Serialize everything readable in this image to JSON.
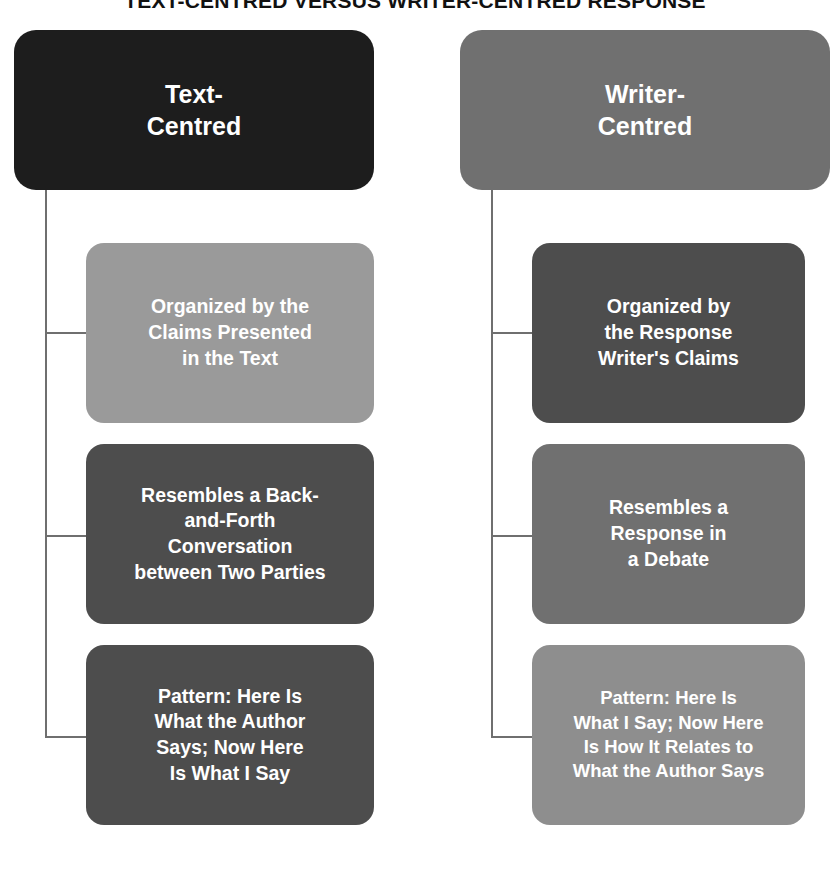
{
  "title": "TEXT-CENTRED VERSUS WRITER-CENTRED RESPONSE",
  "colors": {
    "background": "#ffffff",
    "connector": "#6f6f6f",
    "text_on_node": "#ffffff",
    "title_text": "#111111",
    "near_black": "#1d1d1d",
    "dark_gray": "#4d4d4d",
    "mid_gray": "#636363",
    "gray": "#707070",
    "light_gray": "#9a9a9a",
    "lighter_gray": "#8e8e8e"
  },
  "columns": [
    {
      "id": "text-centred",
      "head": {
        "label": "Text-\nCentred",
        "color": "#1d1d1d"
      },
      "children": [
        {
          "id": "text-centred-organized",
          "label": "Organized by the\nClaims Presented\nin the Text",
          "color": "#9a9a9a"
        },
        {
          "id": "text-centred-resembles",
          "label": "Resembles a Back-\nand-Forth\nConversation\nbetween Two Parties",
          "color": "#4d4d4d"
        },
        {
          "id": "text-centred-pattern",
          "label": "Pattern: Here Is\nWhat the Author\nSays; Now Here\nIs What I Say",
          "color": "#4d4d4d"
        }
      ]
    },
    {
      "id": "writer-centred",
      "head": {
        "label": "Writer-\nCentred",
        "color": "#707070"
      },
      "children": [
        {
          "id": "writer-centred-organized",
          "label": "Organized by\nthe Response\nWriter's Claims",
          "color": "#4d4d4d"
        },
        {
          "id": "writer-centred-resembles",
          "label": "Resembles a\nResponse in\na Debate",
          "color": "#707070"
        },
        {
          "id": "writer-centred-pattern",
          "label": "Pattern: Here Is\nWhat I Say; Now Here\nIs How It Relates to\nWhat the Author Says",
          "color": "#8e8e8e"
        }
      ]
    }
  ]
}
